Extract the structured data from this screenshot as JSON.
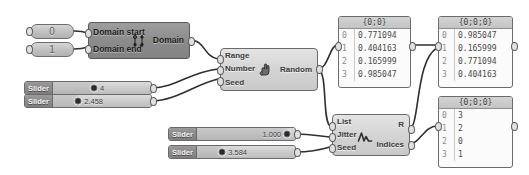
{
  "app": {
    "title": "Grasshopper node graph",
    "canvas_background": "#ffffff",
    "wire_color": "#2f2f2f"
  },
  "number_inputs": [
    {
      "name": "number-input-0",
      "value": "0"
    },
    {
      "name": "number-input-1",
      "value": "1"
    }
  ],
  "components": {
    "domain": {
      "title": "Domain",
      "inputs": [
        "Domain start",
        "Domain end"
      ],
      "outputs": [
        "Domain"
      ],
      "icon": "domain-icon"
    },
    "random": {
      "title": "Random",
      "inputs": [
        "Range",
        "Number",
        "Seed"
      ],
      "outputs": [
        "Random"
      ],
      "icon": "random-hand-icon"
    },
    "jitter": {
      "title": "Jitter",
      "inputs": [
        "List",
        "Jitter",
        "Seed"
      ],
      "outputs": [
        "R",
        "Indices"
      ],
      "icon": "jitter-wave-icon"
    }
  },
  "sliders": [
    {
      "label": "Slider",
      "value": "4",
      "knob_pct": 42
    },
    {
      "label": "Slider",
      "value": "2.458",
      "knob_pct": 26
    },
    {
      "label": "Slider",
      "value": "1.000",
      "knob_pct": 92
    },
    {
      "label": "Slider",
      "value": "3.584",
      "knob_pct": 26
    }
  ],
  "panels": [
    {
      "name": "panel-random-values",
      "header": "{0;0}",
      "rows": [
        {
          "index": "0",
          "value": "0.771094"
        },
        {
          "index": "1",
          "value": "0.404163"
        },
        {
          "index": "2",
          "value": "0.165999"
        },
        {
          "index": "3",
          "value": "0.985047"
        }
      ]
    },
    {
      "name": "panel-jittered-values",
      "header": "{0;0;0}",
      "rows": [
        {
          "index": "0",
          "value": "0.985047"
        },
        {
          "index": "1",
          "value": "0.165999"
        },
        {
          "index": "2",
          "value": "0.771094"
        },
        {
          "index": "3",
          "value": "0.404163"
        }
      ]
    },
    {
      "name": "panel-jitter-indices",
      "header": "{0;0;0}",
      "rows": [
        {
          "index": "0",
          "value": "3"
        },
        {
          "index": "1",
          "value": "2"
        },
        {
          "index": "2",
          "value": "0"
        },
        {
          "index": "3",
          "value": "1"
        }
      ]
    }
  ]
}
